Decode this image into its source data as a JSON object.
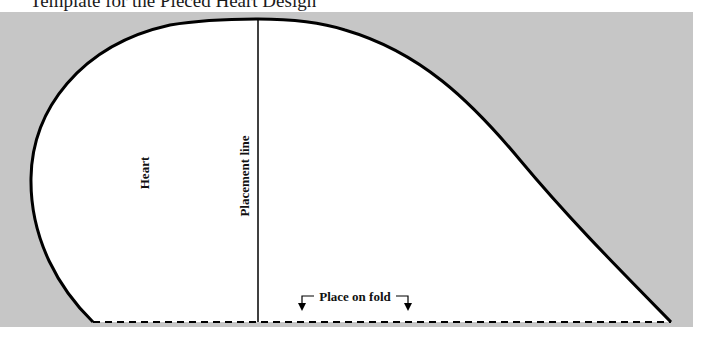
{
  "title": "Template for the Pieced Heart Design",
  "labels": {
    "heart": "Heart",
    "placement_line": "Placement line",
    "fold": "Place on fold"
  },
  "colors": {
    "background_panel": "#c6c6c6",
    "shape_fill": "#ffffff",
    "outline": "#000000"
  },
  "icons": {
    "left_arrow": "arrow-down-left-icon",
    "right_arrow": "arrow-down-right-icon"
  }
}
